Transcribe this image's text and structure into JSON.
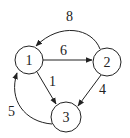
{
  "graph": {
    "type": "directed-weighted",
    "nodes": [
      {
        "id": "1",
        "label": "1",
        "cx": 29,
        "cy": 60,
        "r": 14
      },
      {
        "id": "2",
        "label": "2",
        "cx": 107,
        "cy": 62,
        "r": 14
      },
      {
        "id": "3",
        "label": "3",
        "cx": 66,
        "cy": 117,
        "r": 15
      }
    ],
    "edges": [
      {
        "from": "1",
        "to": "2",
        "weight": "6"
      },
      {
        "from": "2",
        "to": "1",
        "weight": "8"
      },
      {
        "from": "1",
        "to": "3",
        "weight": "1"
      },
      {
        "from": "2",
        "to": "3",
        "weight": "4"
      },
      {
        "from": "3",
        "to": "1",
        "weight": "5"
      }
    ]
  },
  "labels": {
    "node1": "1",
    "node2": "2",
    "node3": "3",
    "edge_1_2": "6",
    "edge_2_1": "8",
    "edge_1_3": "1",
    "edge_2_3": "4",
    "edge_3_1": "5"
  },
  "colors": {
    "stroke": "#222222",
    "background": "#ffffff"
  }
}
